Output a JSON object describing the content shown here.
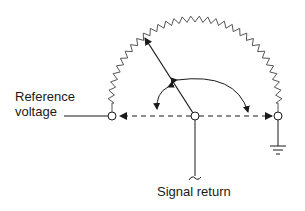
{
  "diagram": {
    "type": "potentiometer-schematic",
    "labels": {
      "reference_line1": "Reference",
      "reference_line2": "voltage",
      "signal_return": "Signal return"
    },
    "components": [
      {
        "name": "resistive-element",
        "shape": "semicircular zigzag"
      },
      {
        "name": "wiper",
        "shape": "arrow from pivot"
      },
      {
        "name": "left-terminal",
        "shape": "open circle"
      },
      {
        "name": "center-pivot",
        "shape": "open circle"
      },
      {
        "name": "right-terminal",
        "shape": "open circle"
      },
      {
        "name": "ground",
        "shape": "ground symbol"
      }
    ],
    "colors": {
      "line": "#1a1a1a",
      "resistor": "#555555",
      "background": "#ffffff"
    }
  }
}
